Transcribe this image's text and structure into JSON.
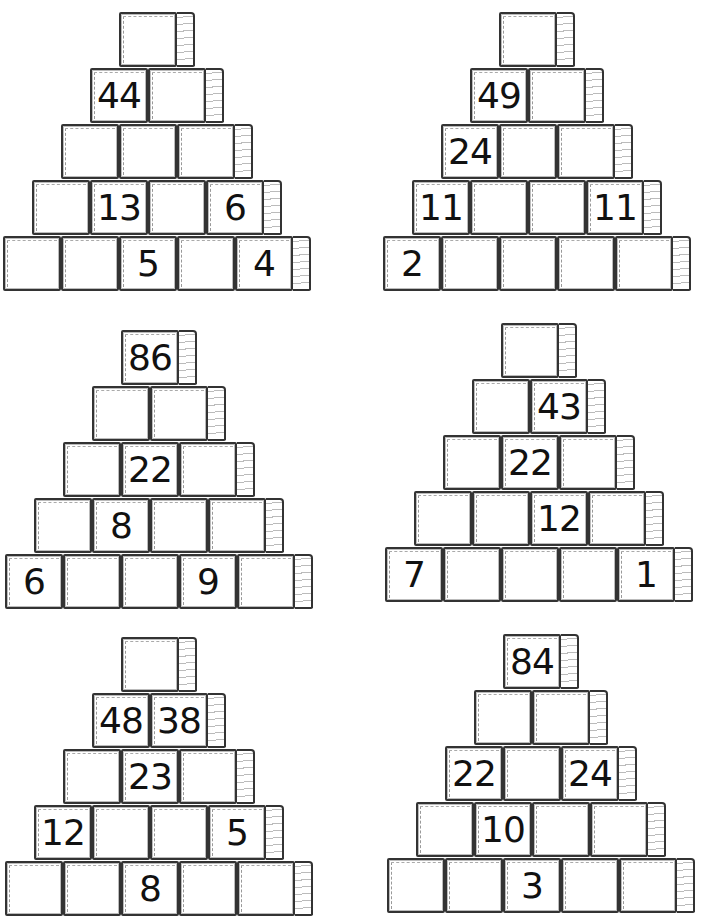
{
  "pyramids": [
    {
      "rows": [
        [
          "",
          "",
          "",
          "",
          ""
        ],
        [
          "",
          "",
          "",
          "",
          ""
        ]
      ]
    }
  ],
  "worksheet": {
    "pyramids": [
      {
        "id": "p1",
        "rows": [
          [
            ""
          ],
          [
            "44",
            ""
          ],
          [
            "",
            "",
            ""
          ],
          [
            "",
            "13",
            "",
            "6"
          ],
          [
            "",
            "",
            "5",
            "",
            "4"
          ]
        ]
      },
      {
        "id": "p2",
        "rows": [
          [
            ""
          ],
          [
            "49",
            ""
          ],
          [
            "24",
            "",
            ""
          ],
          [
            "11",
            "",
            "",
            "11"
          ],
          [
            "2",
            "",
            "",
            "",
            ""
          ]
        ]
      },
      {
        "id": "p3",
        "rows": [
          [
            "86"
          ],
          [
            "",
            ""
          ],
          [
            "",
            "22",
            ""
          ],
          [
            "",
            "8",
            "",
            ""
          ],
          [
            "6",
            "",
            "",
            "9",
            ""
          ]
        ]
      },
      {
        "id": "p4",
        "rows": [
          [
            ""
          ],
          [
            "",
            "43"
          ],
          [
            "",
            "22",
            ""
          ],
          [
            "",
            "",
            "12",
            ""
          ],
          [
            "7",
            "",
            "",
            "",
            "1"
          ]
        ]
      },
      {
        "id": "p5",
        "rows": [
          [
            ""
          ],
          [
            "48",
            "38"
          ],
          [
            "",
            "23",
            ""
          ],
          [
            "12",
            "",
            "",
            "5"
          ],
          [
            "",
            "",
            "8",
            "",
            ""
          ]
        ]
      },
      {
        "id": "p6",
        "rows": [
          [
            "84"
          ],
          [
            "",
            ""
          ],
          [
            "22",
            "",
            "24"
          ],
          [
            "",
            "10",
            "",
            ""
          ],
          [
            "",
            "",
            "3",
            "",
            ""
          ]
        ]
      }
    ]
  }
}
